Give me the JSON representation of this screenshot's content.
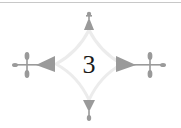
{
  "page": {
    "number": "3",
    "ornament": "concave-diamond-fleuron-frame",
    "colors": {
      "ornament_fill": "#9a9a9a",
      "ornament_light": "#e4e4e4",
      "rule": "#c8c8c8",
      "text": "#1a1a1a"
    }
  }
}
